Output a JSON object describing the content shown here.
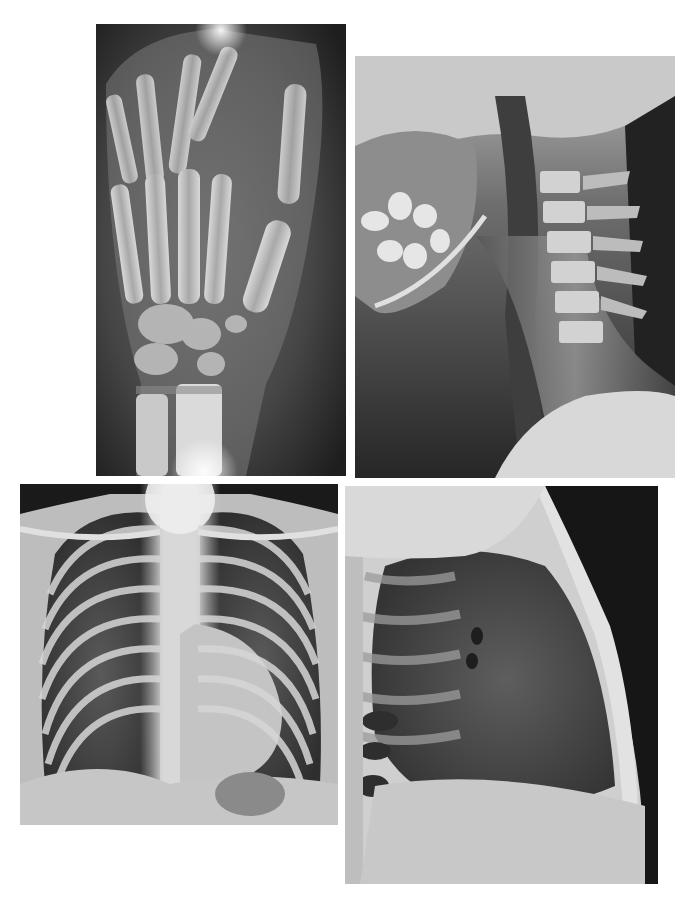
{
  "page": {
    "background": "#ffffff",
    "layout": "2x2 grid of radiograph plates"
  },
  "figures": [
    {
      "id": "hand",
      "label": "Hand and wrist radiograph (PA view)",
      "box": {
        "x": 96,
        "y": 24,
        "w": 250,
        "h": 452
      }
    },
    {
      "id": "cervical",
      "label": "Lateral cervical spine radiograph",
      "box": {
        "x": 355,
        "y": 56,
        "w": 320,
        "h": 422
      }
    },
    {
      "id": "chest-pa",
      "label": "Chest radiograph (PA view)",
      "box": {
        "x": 20,
        "y": 484,
        "w": 318,
        "h": 341
      }
    },
    {
      "id": "chest-lateral",
      "label": "Chest radiograph (lateral view)",
      "box": {
        "x": 345,
        "y": 486,
        "w": 313,
        "h": 398
      }
    }
  ]
}
